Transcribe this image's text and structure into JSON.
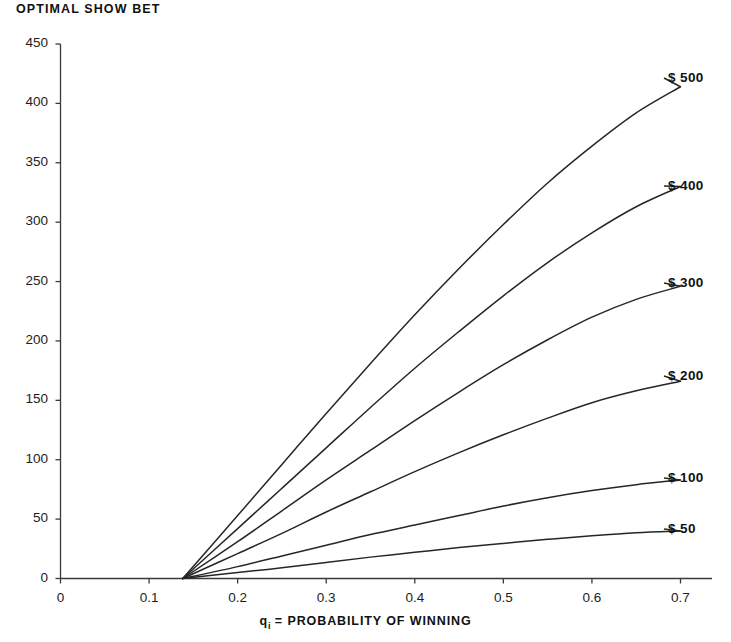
{
  "chart_data": {
    "type": "line",
    "title": "OPTIMAL SHOW BET",
    "subtitle": "",
    "xlabel_prefix": "q",
    "xlabel_sub": "i",
    "xlabel_rest": " =  PROBABILITY OF WINNING",
    "xlabel": "qi =  PROBABILITY OF WINNING",
    "ylabel": "",
    "xlim": [
      0,
      0.74
    ],
    "ylim": [
      0,
      450
    ],
    "xticks": [
      0,
      0.1,
      0.2,
      0.3,
      0.4,
      0.5,
      0.6,
      0.7
    ],
    "xtick_labels": [
      "0",
      "0.1",
      "0.2",
      "0.3",
      "0.4",
      "0.5",
      "0.6",
      "0.7"
    ],
    "yticks": [
      0,
      50,
      100,
      150,
      200,
      250,
      300,
      350,
      400,
      450
    ],
    "ytick_labels": [
      "0",
      "50",
      "100",
      "150",
      "200",
      "250",
      "300",
      "350",
      "400",
      "450"
    ],
    "grid": false,
    "legend_position": "right-of-curve-ends",
    "x": [
      0.138,
      0.2,
      0.25,
      0.3,
      0.35,
      0.4,
      0.45,
      0.5,
      0.55,
      0.6,
      0.65,
      0.7
    ],
    "series": [
      {
        "name": "$ 500",
        "label": "$ 500",
        "values": [
          0,
          53,
          96,
          139,
          181,
          222,
          261,
          298,
          333,
          364,
          392,
          414
        ]
      },
      {
        "name": "$ 400",
        "label": "$ 400",
        "values": [
          0,
          42,
          76,
          110,
          144,
          177,
          208,
          238,
          266,
          291,
          313,
          330
        ]
      },
      {
        "name": "$ 300",
        "label": "$ 300",
        "values": [
          0,
          31,
          57,
          83,
          108,
          133,
          157,
          180,
          201,
          220,
          235,
          246
        ]
      },
      {
        "name": "$ 200",
        "label": "$ 200",
        "values": [
          0,
          21,
          38,
          56,
          73,
          90,
          106,
          121,
          135,
          148,
          158,
          166
        ]
      },
      {
        "name": "$ 100",
        "label": "$ 100",
        "values": [
          0,
          10,
          19,
          28,
          37,
          45,
          53,
          61,
          68,
          74,
          79,
          83
        ]
      },
      {
        "name": "$ 50",
        "label": "$ 50",
        "values": [
          0,
          5,
          9,
          13.5,
          18,
          22,
          26,
          29.5,
          33,
          36,
          38.5,
          40
        ]
      }
    ],
    "label_positions": [
      {
        "label": "$ 500",
        "left": 668,
        "top": 70
      },
      {
        "label": "$ 400",
        "left": 668,
        "top": 178
      },
      {
        "label": "$ 300",
        "left": 668,
        "top": 275
      },
      {
        "label": "$ 200",
        "left": 668,
        "top": 368
      },
      {
        "label": "$ 100",
        "left": 668,
        "top": 470
      },
      {
        "label": "$ 50",
        "left": 668,
        "top": 521
      }
    ]
  }
}
